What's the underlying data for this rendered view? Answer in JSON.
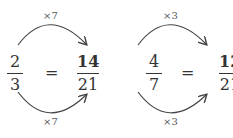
{
  "equations": [
    {
      "left": {
        "numerator": "2",
        "denominator": "3"
      },
      "equals": "=",
      "right": {
        "numerator": "14",
        "denominator": "21"
      },
      "top_multiplier": "×7",
      "bottom_multiplier": "×7"
    },
    {
      "left": {
        "numerator": "4",
        "denominator": "7"
      },
      "equals": "=",
      "right": {
        "numerator": "12",
        "denominator": "21"
      },
      "top_multiplier": "×3",
      "bottom_multiplier": "×3"
    }
  ]
}
